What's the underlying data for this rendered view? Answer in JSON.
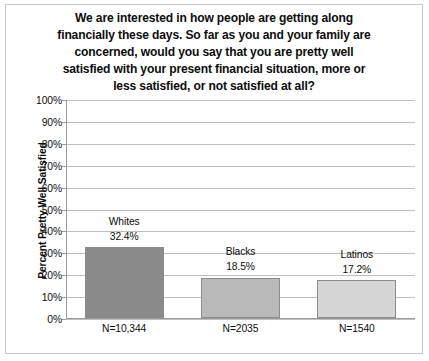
{
  "chart_data": {
    "type": "bar",
    "title_lines": [
      "We are interested in how people are getting along",
      "financially these days. So far as you and your family are",
      "concerned, would you say that you are pretty well",
      "satisfied with your present financial situation, more or",
      "less satisfied, or not satisfied at all?"
    ],
    "categories": [
      "Whites",
      "Blacks",
      "Latinos"
    ],
    "values": [
      32.4,
      17.2,
      17.2
    ],
    "series": [
      {
        "name": "Percent Pretty Well Satisfied",
        "values": [
          32.4,
          18.5,
          17.2
        ]
      }
    ],
    "value_labels": [
      "32.4%",
      "18.5%",
      "17.2%"
    ],
    "sample_sizes": [
      "N=10,344",
      "N=2035",
      "N=1540"
    ],
    "bar_colors": [
      "#8a8a8a",
      "#b9b9b9",
      "#d6d6d6"
    ],
    "xlabel": "",
    "ylabel": "Percent Pretty Well Satisfied",
    "ylim": [
      0,
      100
    ],
    "ytick_labels": [
      "100%",
      "90%",
      "80%",
      "70%",
      "60%",
      "50%",
      "40%",
      "30%",
      "20%",
      "10%",
      "0%"
    ],
    "ytick_values": [
      100,
      90,
      80,
      70,
      60,
      50,
      40,
      30,
      20,
      10,
      0
    ],
    "grid": true,
    "legend": "none"
  }
}
